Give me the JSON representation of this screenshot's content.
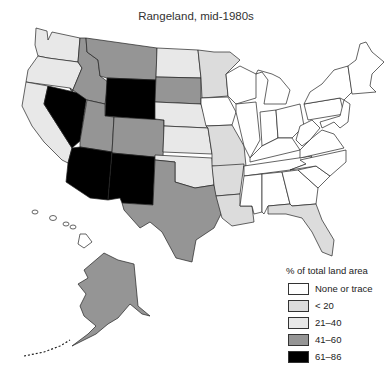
{
  "title": "Rangeland, mid-1980s",
  "legend": {
    "title": "% of total land area",
    "items": [
      {
        "label": "None or trace",
        "color": "#ffffff"
      },
      {
        "label": "< 20",
        "color": "#dcdcdc"
      },
      {
        "label": "21–40",
        "color": "#e8e8e8"
      },
      {
        "label": "41–60",
        "color": "#959595"
      },
      {
        "label": "61–86",
        "color": "#000000"
      }
    ]
  },
  "map": {
    "region": "United States",
    "states": {
      "WA": "21-40",
      "OR": "21-40",
      "CA": "21-40",
      "NV": "61-86",
      "ID": "41-60",
      "MT": "41-60",
      "WY": "61-86",
      "UT": "41-60",
      "CO": "41-60",
      "AZ": "61-86",
      "NM": "61-86",
      "ND": "21-40",
      "SD": "41-60",
      "NE": "21-40",
      "KS": "21-40",
      "OK": "21-40",
      "TX": "41-60",
      "MN": "<20",
      "IA": "None or trace",
      "MO": "<20",
      "AR": "<20",
      "LA": "<20",
      "FL": "<20",
      "AK": "41-60",
      "HI": "None or trace"
    }
  }
}
